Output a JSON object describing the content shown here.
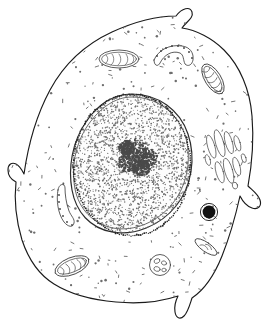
{
  "figure": {
    "type": "biological-line-drawing",
    "style": "black-and-white stippled pen-and-ink illustration",
    "background_color": "#ffffff",
    "line_color": "#1a1a1a",
    "canvas": {
      "width": 276,
      "height": 326
    },
    "labels_present": false,
    "caption": ""
  },
  "structures": {
    "cell_membrane": {
      "name": "Plasma membrane",
      "description": "Irregular rounded cell boundary with four finger-like protrusions",
      "stroke_color": "#1a1a1a",
      "protrusions": [
        {
          "name": "top-hook-protrusion",
          "position": "top-center",
          "shape": "hooked finger pointing up-right"
        },
        {
          "name": "left-point-protrusion",
          "position": "left-middle",
          "shape": "narrow pointed spike"
        },
        {
          "name": "right-notch-protrusion",
          "position": "right-lower",
          "shape": "short blunt lobe"
        },
        {
          "name": "bottom-finger-protrusion",
          "position": "bottom-center",
          "shape": "narrow downward finger"
        }
      ]
    },
    "nucleus": {
      "name": "Nucleus",
      "description": "Large ovoid body occupying the cell center, filled with fine stipple (chromatin)",
      "envelope": "double membrane studded with dark ribosome dots",
      "center": {
        "x": 132,
        "y": 165
      },
      "radius_x": 58,
      "radius_y": 70
    },
    "nucleolus": {
      "name": "Nucleolus",
      "description": "Irregular dense stipple patch inside the nucleus",
      "center": {
        "x": 138,
        "y": 157
      }
    },
    "mitochondria": [
      {
        "name": "mitochondrion-upper-left",
        "position": "upper-left cytoplasm",
        "orientation": "horizontal",
        "cristae": 5
      },
      {
        "name": "mitochondrion-upper-right",
        "position": "upper-right cytoplasm",
        "orientation": "diagonal",
        "cristae": 5
      },
      {
        "name": "mitochondrion-lower-left",
        "position": "lower-left cytoplasm",
        "orientation": "diagonal",
        "cristae": 5
      }
    ],
    "golgi": {
      "name": "Golgi apparatus",
      "description": "Stack of elongated flattened cisternae with adjacent small vesicles",
      "position": "right of nucleus",
      "cisternae": 7
    },
    "lysosome": {
      "name": "Lysosome",
      "description": "Solid black sphere surrounded by a thin membrane ring",
      "position": "right-lower cytoplasm",
      "fill_color": "#111111"
    },
    "endoplasmic_reticulum": [
      {
        "name": "er-cisterna-top",
        "position": "upper-center",
        "shape": "curved tube studded with ribosome dots"
      },
      {
        "name": "er-cisterna-left",
        "position": "left-middle",
        "shape": "elongated curved tube with ribosome dots"
      }
    ],
    "vesicles": [
      {
        "name": "multivesicular-body",
        "position": "bottom-center",
        "shape": "round vesicle containing small internal droplets"
      },
      {
        "name": "lens-vesicle",
        "position": "bottom-right",
        "shape": "elongated lens-shaped vesicle"
      }
    ],
    "cytoplasm": {
      "name": "Cytoplasm",
      "description": "Pale ground substance scattered with small comma-shaped free ribosome marks",
      "texture": "scattered tick and comma marks"
    }
  }
}
